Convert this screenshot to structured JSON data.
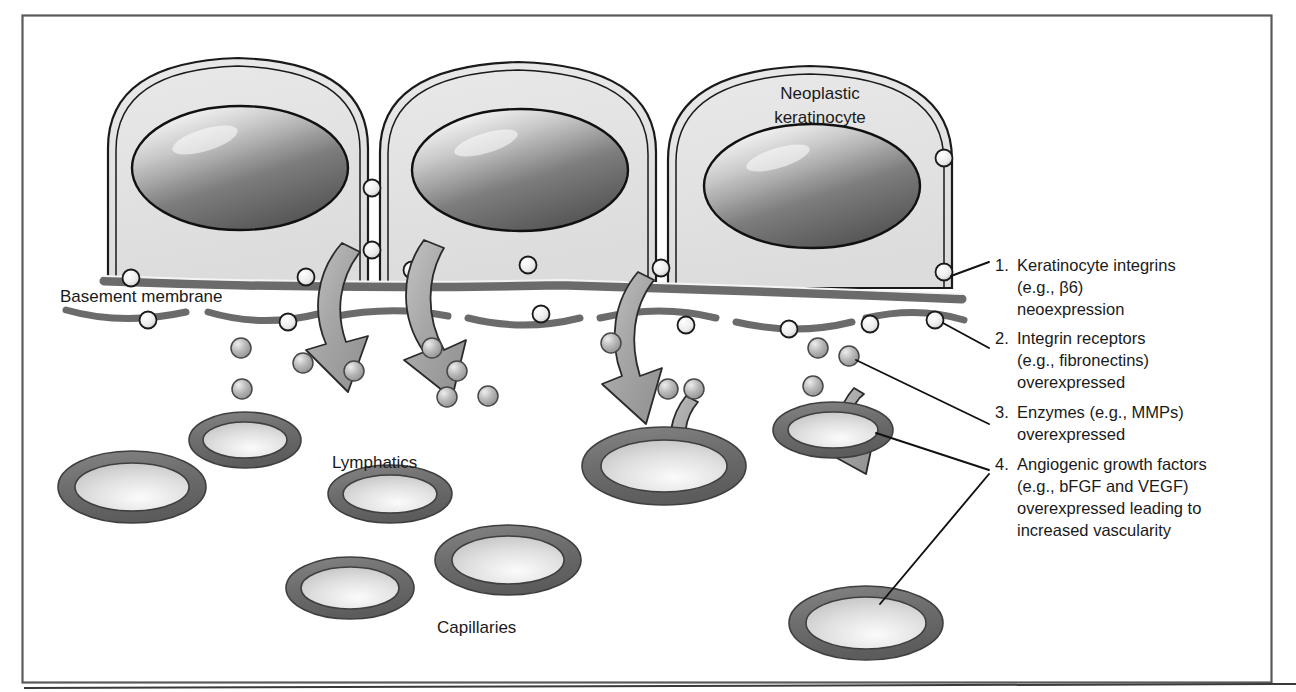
{
  "figure": {
    "kind": "biomedical-schematic",
    "frame_color": "#5a5a5a",
    "background": "#ffffff"
  },
  "palette": {
    "cell_fill": "#e3e3e3",
    "cell_outline": "#1a1a1a",
    "nucleus_dark": "#5d5d5d",
    "nucleus_light": "#eceaea",
    "membrane_band": "#6b6b6b",
    "vessel_ring": "#6f6f6f",
    "vessel_lumen": "#d8d8d8",
    "arrow_fill": "#a9a9a9",
    "dot_fill": "#b6b6b6",
    "receptor_fill": "#f2f2f2",
    "leader_line": "#111111",
    "text": "#1a1a1a"
  },
  "inline_labels": [
    {
      "id": "neoplastic-keratinocyte",
      "line1": "Neoplastic",
      "line2": "keratinocyte",
      "x": 820,
      "y": 99
    },
    {
      "id": "basement-membrane",
      "text": "Basement membrane",
      "x": 60,
      "y": 302
    },
    {
      "id": "lymphatics",
      "text": "Lymphatics",
      "x": 332,
      "y": 468
    },
    {
      "id": "capillaries",
      "text": "Capillaries",
      "x": 437,
      "y": 633
    }
  ],
  "legend": {
    "x": 995,
    "items": [
      {
        "number": "1.",
        "lines": [
          "Keratinocyte integrins",
          "(e.g., β6)",
          "neoexpression"
        ],
        "y": 271
      },
      {
        "number": "2.",
        "lines": [
          "Integrin receptors",
          "(e.g., fibronectins)",
          "overexpressed"
        ],
        "y": 344
      },
      {
        "number": "3.",
        "lines": [
          "Enzymes (e.g., MMPs)",
          "overexpressed"
        ],
        "y": 418
      },
      {
        "number": "4.",
        "lines": [
          "Angiogenic growth factors",
          "(e.g., bFGF and VEGF)",
          "overexpressed leading to",
          "increased vascularity"
        ],
        "y": 470
      }
    ]
  },
  "cells": [
    {
      "id": "keratinocyte-1",
      "cx": 238,
      "cy": 160
    },
    {
      "id": "keratinocyte-2",
      "cx": 518,
      "cy": 160
    },
    {
      "id": "keratinocyte-3",
      "cx": 806,
      "cy": 165
    }
  ],
  "vessels": [
    {
      "id": "vessel-lymphatic-upper-left",
      "cx": 245,
      "cy": 440,
      "rx": 56,
      "ry": 28,
      "group": "lymphatics"
    },
    {
      "id": "vessel-lymphatic-left",
      "cx": 132,
      "cy": 487,
      "rx": 74,
      "ry": 36,
      "group": "lymphatics"
    },
    {
      "id": "vessel-lymphatic-mid",
      "cx": 390,
      "cy": 494,
      "rx": 62,
      "ry": 29,
      "group": "lymphatics"
    },
    {
      "id": "vessel-capillary-center",
      "cx": 508,
      "cy": 560,
      "rx": 73,
      "ry": 35,
      "group": "capillaries"
    },
    {
      "id": "vessel-capillary-left",
      "cx": 350,
      "cy": 588,
      "rx": 64,
      "ry": 31,
      "group": "capillaries"
    },
    {
      "id": "vessel-capillary-right",
      "cx": 664,
      "cy": 466,
      "rx": 82,
      "ry": 39,
      "group": "capillaries"
    },
    {
      "id": "vessel-capillary-upper-right",
      "cx": 833,
      "cy": 430,
      "rx": 60,
      "ry": 28,
      "group": "capillaries"
    },
    {
      "id": "vessel-capillary-bottom-right",
      "cx": 866,
      "cy": 623,
      "rx": 77,
      "ry": 37,
      "group": "capillaries"
    }
  ],
  "counts": {
    "cells": 3,
    "invasion_arrows": 5,
    "vessels": 8,
    "legend_items": 4
  }
}
